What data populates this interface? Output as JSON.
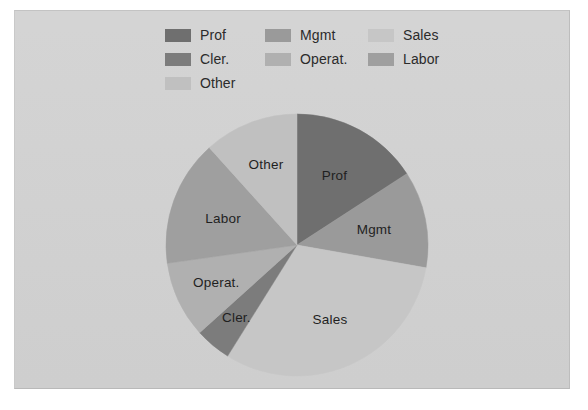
{
  "figure": {
    "background_color": "#ffffff",
    "plate_color": "#d2d2d2"
  },
  "legend": {
    "position": "top",
    "columns": 3,
    "items": [
      {
        "label": "Prof",
        "color": "#6f6f6f",
        "col": 0,
        "row": 0
      },
      {
        "label": "Cler.",
        "color": "#7c7c7c",
        "col": 0,
        "row": 1
      },
      {
        "label": "Other",
        "color": "#c0c0c0",
        "col": 0,
        "row": 2
      },
      {
        "label": "Mgmt",
        "color": "#9a9a9a",
        "col": 1,
        "row": 0
      },
      {
        "label": "Operat.",
        "color": "#b0b0b0",
        "col": 1,
        "row": 1
      },
      {
        "label": "Sales",
        "color": "#c6c6c6",
        "col": 2,
        "row": 0
      },
      {
        "label": "Labor",
        "color": "#9f9f9f",
        "col": 2,
        "row": 1
      }
    ]
  },
  "chart_data": {
    "type": "pie",
    "title": "",
    "xlabel": "",
    "ylabel": "",
    "start_angle_deg": 0,
    "direction": "clockwise",
    "center": {
      "x": 133,
      "y": 133
    },
    "radius": 131,
    "label_radius_fraction": 0.6,
    "categories": [
      "Prof",
      "Mgmt",
      "Sales",
      "Cler.",
      "Operat.",
      "Labor",
      "Other"
    ],
    "values": [
      15.8,
      11.9,
      31.1,
      4.5,
      9.4,
      15.6,
      11.7
    ],
    "unit": "percent",
    "angles_deg": [
      57,
      43,
      112,
      16,
      34,
      56,
      42
    ],
    "slices": [
      {
        "label": "Prof",
        "value": 15.8,
        "angle_deg": 57,
        "start_deg": 0,
        "end_deg": 57,
        "color": "#6f6f6f"
      },
      {
        "label": "Mgmt",
        "value": 11.9,
        "angle_deg": 43,
        "start_deg": 57,
        "end_deg": 100,
        "color": "#9a9a9a"
      },
      {
        "label": "Sales",
        "value": 31.1,
        "angle_deg": 112,
        "start_deg": 100,
        "end_deg": 212,
        "color": "#c6c6c6"
      },
      {
        "label": "Cler.",
        "value": 4.5,
        "angle_deg": 16,
        "start_deg": 212,
        "end_deg": 228,
        "color": "#7c7c7c"
      },
      {
        "label": "Operat.",
        "value": 9.4,
        "angle_deg": 34,
        "start_deg": 228,
        "end_deg": 262,
        "color": "#b0b0b0"
      },
      {
        "label": "Labor",
        "value": 15.6,
        "angle_deg": 56,
        "start_deg": 262,
        "end_deg": 318,
        "color": "#9f9f9f"
      },
      {
        "label": "Other",
        "value": 11.7,
        "angle_deg": 42,
        "start_deg": 318,
        "end_deg": 360,
        "color": "#c0c0c0"
      }
    ],
    "legend_position": "top",
    "grid": false
  }
}
